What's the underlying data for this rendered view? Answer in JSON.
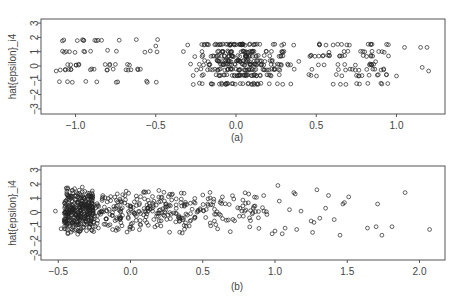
{
  "chart_data": [
    {
      "id": "a",
      "type": "scatter",
      "title": "",
      "panel_label": "(a)",
      "xlabel": "",
      "ylabel": "hat{epsilon}_i4",
      "xlim": [
        -1.2,
        1.3
      ],
      "ylim": [
        -3.2,
        3.2
      ],
      "xticks": [
        -1.0,
        -0.5,
        0.0,
        0.5,
        1.0
      ],
      "xtick_labels": [
        "−1.0",
        "−0.5",
        "0.0",
        "0.5",
        "1.0"
      ],
      "yticks": [
        -3,
        -2,
        -1,
        0,
        1,
        2,
        3
      ],
      "ytick_labels": [
        "−3",
        "−2",
        "−1",
        "0",
        "1",
        "2",
        "3"
      ],
      "grid": false,
      "legend": null,
      "marker": "open-circle",
      "description": "Residuals arranged in horizontal bands (discrete-valued response); x spread from about -1.1 to 1.2, y roughly between -1.3 and 1.9",
      "bands_y": [
        1.8,
        1.5,
        1.0,
        0.7,
        0.35,
        0.1,
        -0.25,
        -0.65,
        -1.1,
        -1.25
      ],
      "generator": {
        "seed": 17,
        "groups": [
          {
            "n": 60,
            "x_range": [
              -1.1,
              -0.45
            ],
            "bands": [
              1.8,
              0.1,
              -1.1,
              -0.25,
              1.0
            ]
          },
          {
            "n": 330,
            "x_range": [
              -0.4,
              0.45
            ],
            "bands": [
              1.5,
              1.0,
              0.7,
              0.35,
              0.1,
              -0.25,
              -0.65,
              -1.25
            ],
            "x_center": -0.05
          },
          {
            "n": 90,
            "x_range": [
              0.45,
              0.95
            ],
            "bands": [
              1.5,
              1.0,
              0.7,
              0.1,
              -0.25,
              -0.65,
              -1.25
            ]
          }
        ],
        "jitter_y": 0.05
      },
      "points_extra": [
        {
          "x": -1.12,
          "y": -0.35
        },
        {
          "x": -1.1,
          "y": -1.1
        },
        {
          "x": -1.05,
          "y": -1.1
        },
        {
          "x": -0.95,
          "y": 1.8
        },
        {
          "x": -0.88,
          "y": 1.8
        },
        {
          "x": -0.86,
          "y": 1.8
        },
        {
          "x": -0.8,
          "y": 1.1
        },
        {
          "x": -0.5,
          "y": 1.4
        },
        {
          "x": 1.0,
          "y": -0.7
        },
        {
          "x": 1.05,
          "y": 1.3
        },
        {
          "x": 1.15,
          "y": 1.3
        },
        {
          "x": 1.19,
          "y": 1.3
        },
        {
          "x": 1.16,
          "y": -0.1
        },
        {
          "x": 1.2,
          "y": -0.35
        },
        {
          "x": 0.95,
          "y": 0.7
        },
        {
          "x": 0.92,
          "y": -0.2
        },
        {
          "x": 0.87,
          "y": 0.3
        }
      ]
    },
    {
      "id": "b",
      "type": "scatter",
      "title": "",
      "panel_label": "(b)",
      "xlabel": "",
      "ylabel": "hat{epsilon}_i4",
      "xlim": [
        -0.6,
        2.15
      ],
      "ylim": [
        -3.2,
        3.2
      ],
      "xticks": [
        -0.5,
        0.0,
        0.5,
        1.0,
        1.5,
        2.0
      ],
      "xtick_labels": [
        "−0.5",
        "0.0",
        "0.5",
        "1.0",
        "1.5",
        "2.0"
      ],
      "yticks": [
        -3,
        -2,
        -1,
        0,
        1,
        2,
        3
      ],
      "ytick_labels": [
        "−3",
        "−2",
        "−1",
        "0",
        "1",
        "2",
        "3"
      ],
      "grid": false,
      "legend": null,
      "marker": "open-circle",
      "description": "Residuals heavily concentrated near x about -0.35 and thinning to the right; y between about -1.7 and 1.9",
      "generator": {
        "seed": 29,
        "groups": [
          {
            "n": 330,
            "x_range": [
              -0.46,
              -0.25
            ],
            "y_range": [
              -1.6,
              1.9
            ]
          },
          {
            "n": 230,
            "x_range": [
              -0.25,
              0.4
            ],
            "y_range": [
              -1.6,
              1.8
            ]
          },
          {
            "n": 90,
            "x_range": [
              0.4,
              0.95
            ],
            "y_range": [
              -1.5,
              1.8
            ]
          }
        ]
      },
      "points_extra": [
        {
          "x": -0.52,
          "y": 0.1
        },
        {
          "x": -0.48,
          "y": -1.15
        },
        {
          "x": -0.45,
          "y": -1.15
        },
        {
          "x": 0.98,
          "y": -1.5
        },
        {
          "x": 1.0,
          "y": -1.3
        },
        {
          "x": 1.02,
          "y": 1.9
        },
        {
          "x": 1.03,
          "y": 0.8
        },
        {
          "x": 1.05,
          "y": -1.5
        },
        {
          "x": 1.07,
          "y": -1.1
        },
        {
          "x": 1.1,
          "y": 0.2
        },
        {
          "x": 1.13,
          "y": 1.4
        },
        {
          "x": 1.14,
          "y": 1.3
        },
        {
          "x": 1.15,
          "y": -1.2
        },
        {
          "x": 1.18,
          "y": 0.1
        },
        {
          "x": 1.25,
          "y": -0.6
        },
        {
          "x": 1.26,
          "y": -1.4
        },
        {
          "x": 1.27,
          "y": -0.7
        },
        {
          "x": 1.29,
          "y": 1.6
        },
        {
          "x": 1.31,
          "y": -0.4
        },
        {
          "x": 1.35,
          "y": 0.3
        },
        {
          "x": 1.37,
          "y": 1.2
        },
        {
          "x": 1.41,
          "y": -0.5
        },
        {
          "x": 1.45,
          "y": -1.6
        },
        {
          "x": 1.47,
          "y": 0.6
        },
        {
          "x": 1.48,
          "y": 0.7
        },
        {
          "x": 1.51,
          "y": 1.1
        },
        {
          "x": 1.64,
          "y": -1.1
        },
        {
          "x": 1.7,
          "y": -1.0
        },
        {
          "x": 1.71,
          "y": 0.6
        },
        {
          "x": 1.74,
          "y": -1.6
        },
        {
          "x": 1.81,
          "y": -1.0
        },
        {
          "x": 1.9,
          "y": 1.4
        },
        {
          "x": 2.07,
          "y": -1.2
        }
      ]
    }
  ],
  "layout": {
    "panels": [
      {
        "box": {
          "left": 41,
          "top": 19,
          "right": 445,
          "bottom": 114
        },
        "x_px_per_unit": 160.5,
        "x_zero_px": 236,
        "y_zero_px": 66,
        "y_px_per_unit": 14.3,
        "panel_label_pos": {
          "x": 237,
          "y": 141
        }
      },
      {
        "box": {
          "left": 41,
          "top": 166,
          "right": 445,
          "bottom": 260
        },
        "x_px_per_unit": 144.5,
        "x_zero_px": 130.5,
        "y_zero_px": 212.5,
        "y_px_per_unit": 14.2,
        "panel_label_pos": {
          "x": 237,
          "y": 290
        }
      }
    ],
    "colors": {
      "axis": "#555555",
      "marker": "#222222",
      "text": "#444444"
    }
  }
}
